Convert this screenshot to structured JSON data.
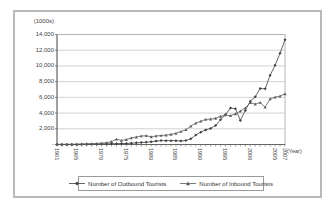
{
  "chart_data": {
    "type": "line",
    "title": "",
    "y_axis_label": "(1000s)",
    "x_axis_label": "(Year)",
    "ylim": [
      0,
      14000
    ],
    "ytick_step": 2000,
    "yticks": [
      {
        "value": 0,
        "label": "-"
      },
      {
        "value": 2000,
        "label": "2,000"
      },
      {
        "value": 4000,
        "label": "4,000"
      },
      {
        "value": 6000,
        "label": "6,000"
      },
      {
        "value": 8000,
        "label": "8,000"
      },
      {
        "value": 10000,
        "label": "10,000"
      },
      {
        "value": 12000,
        "label": "12,000"
      },
      {
        "value": 14000,
        "label": "14,000"
      }
    ],
    "x_start_year": 1961,
    "x_end_year": 2007,
    "x_tick_labels": [
      "1961",
      "1965",
      "1970",
      "1975",
      "1980",
      "1985",
      "1990",
      "1995",
      "2000",
      "2005",
      "2007"
    ],
    "grid": true,
    "legend_position": "bottom",
    "colors": {
      "grid": "#b3b3b3",
      "axis": "#666666",
      "plot_border": "#999999"
    },
    "series": [
      {
        "name": "Number of Outbound Tourists",
        "marker": "diamond",
        "color": "#3f3f3f",
        "values": [
          11,
          10,
          11,
          12,
          15,
          22,
          34,
          38,
          44,
          73,
          76,
          84,
          101,
          121,
          129,
          164,
          209,
          260,
          296,
          339,
          436,
          499,
          493,
          493,
          484,
          455,
          511,
          725,
          1213,
          1561,
          1856,
          2043,
          2420,
          3154,
          3819,
          4649,
          4542,
          3067,
          4342,
          5508,
          6084,
          7123,
          7086,
          8826,
          10080,
          11610,
          13325
        ]
      },
      {
        "name": "Number of Inbound Tourists",
        "marker": "triangle",
        "color": "#5c5c5c",
        "values": [
          11,
          15,
          22,
          24,
          33,
          68,
          84,
          103,
          126,
          173,
          233,
          371,
          679,
          518,
          633,
          834,
          950,
          1079,
          1126,
          976,
          1093,
          1145,
          1194,
          1297,
          1426,
          1660,
          1875,
          2340,
          2728,
          2959,
          3196,
          3231,
          3331,
          3580,
          3753,
          3684,
          3908,
          4250,
          4660,
          5322,
          5147,
          5347,
          4753,
          5818,
          6023,
          6155,
          6448
        ]
      }
    ]
  }
}
